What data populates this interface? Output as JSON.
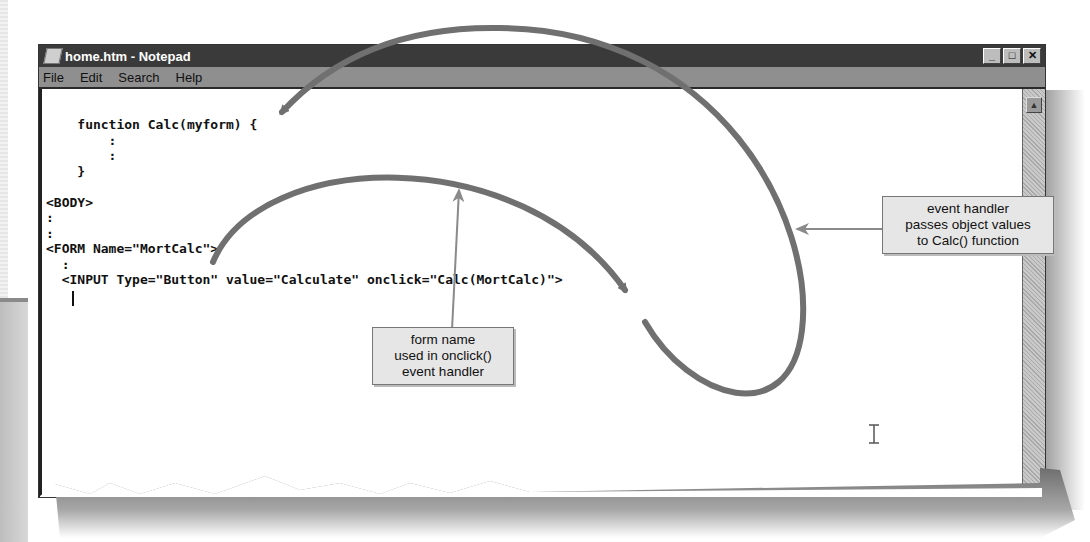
{
  "window": {
    "title": "home.htm - Notepad",
    "controls": {
      "minimize": "_",
      "maximize": "□",
      "close": "✕"
    }
  },
  "menu": {
    "items": [
      {
        "label": "File"
      },
      {
        "label": "Edit"
      },
      {
        "label": "Search"
      },
      {
        "label": "Help"
      }
    ]
  },
  "editor": {
    "lines": [
      "    function Calc(myform) {",
      "        :",
      "        :",
      "    }",
      "",
      "<BODY>",
      ":",
      ":",
      "<FORM Name=\"MortCalc\">",
      "  :",
      "  <INPUT Type=\"Button\" value=\"Calculate\" onclick=\"Calc(MortCalc)\">"
    ]
  },
  "scrollbar": {
    "up_arrow": "▲"
  },
  "callouts": {
    "form_name": {
      "lines": [
        "form name",
        "used in onclick()",
        "event handler"
      ]
    },
    "event_handler": {
      "lines": [
        "event handler",
        "passes object values",
        "to Calc() function"
      ]
    }
  },
  "colors": {
    "title_bar": "#3a3a3a",
    "menu_bar": "#8f8f8f",
    "arrow": "#707070",
    "callout_bg": "#e6e6e6"
  }
}
